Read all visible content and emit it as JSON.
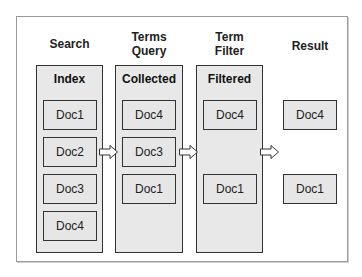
{
  "headings": {
    "search": "Search",
    "terms_query": [
      "Terms",
      "Query"
    ],
    "term_filter": [
      "Term",
      "Filter"
    ],
    "result": "Result"
  },
  "columns": {
    "index": {
      "title": "Index",
      "docs": [
        "Doc1",
        "Doc2",
        "Doc3",
        "Doc4"
      ]
    },
    "collected": {
      "title": "Collected",
      "docs": [
        "Doc4",
        "Doc3",
        "Doc1"
      ]
    },
    "filtered": {
      "title": "Filtered",
      "docs": [
        "Doc4",
        "Doc1"
      ]
    }
  },
  "result": {
    "docs": [
      "Doc4",
      "Doc1"
    ]
  },
  "colors": {
    "box_fill": "#e8e8e8",
    "border": "#333333",
    "frame": "#9a9a9a"
  }
}
